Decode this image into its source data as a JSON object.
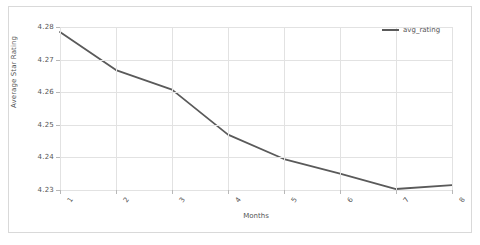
{
  "chart_data": {
    "type": "line",
    "title": "",
    "xlabel": "Months",
    "ylabel": "Average Star Rating",
    "x": [
      1,
      2,
      3,
      4,
      5,
      6,
      7,
      8
    ],
    "xtick_labels": [
      "1",
      "2",
      "3",
      "4",
      "5",
      "6",
      "7",
      "8"
    ],
    "ytick_labels": [
      "4.28",
      "4.27",
      "4.26",
      "4.25",
      "4.24",
      "4.23"
    ],
    "ytick_values": [
      4.28,
      4.27,
      4.26,
      4.25,
      4.24,
      4.23
    ],
    "xlim": [
      1,
      8
    ],
    "ylim": [
      4.23,
      4.28
    ],
    "grid": true,
    "legend_position": "top-right",
    "series": [
      {
        "name": "avg_rating",
        "color": "#5a5a5a",
        "values": [
          4.2785,
          4.2668,
          4.2608,
          4.247,
          4.2395,
          4.235,
          4.2303,
          4.2315
        ]
      }
    ]
  },
  "legend": {
    "entries": [
      {
        "label": "avg_rating"
      }
    ]
  },
  "axes": {
    "y_label": "Average Star Rating",
    "x_label": "Months"
  }
}
